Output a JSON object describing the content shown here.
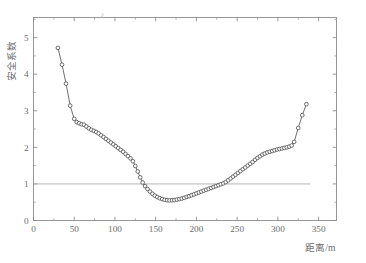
{
  "figure": {
    "background_color": "#ffffff",
    "line_color": "#4a4a4a",
    "axis_color": "#8d8d8d",
    "text_color": "#6b6b6b",
    "refline_color": "#a9a9a9"
  },
  "chart_data": {
    "type": "line",
    "title": "",
    "subtitle": "",
    "xlabel": "距离/m",
    "ylabel": "安全系数",
    "xlim": [
      0,
      372
    ],
    "ylim": [
      0,
      5.55
    ],
    "xticks": [
      0,
      50,
      100,
      150,
      200,
      250,
      300,
      350
    ],
    "xticklabels": [
      "0",
      "50",
      "100",
      "150",
      "200",
      "250",
      "300",
      "350"
    ],
    "yticks": [
      0,
      1,
      2,
      3,
      4,
      5
    ],
    "yticklabels": [
      "0",
      "1",
      "2",
      "3",
      "4",
      "5"
    ],
    "x_minor_tick_step": 25,
    "y_minor_tick_step": 0.5,
    "grid": false,
    "legend": null,
    "marker": "open-circle",
    "annotations": [
      {
        "kind": "reference-line",
        "orientation": "horizontal",
        "y": 1.0,
        "x_start": 0,
        "x_end": 340,
        "label": "safety factor = 1.0"
      }
    ],
    "series": [
      {
        "name": "安全系数",
        "x": [
          30,
          35,
          40,
          45,
          50,
          53,
          56,
          59,
          62,
          65,
          68,
          71,
          74,
          77,
          80,
          83,
          86,
          89,
          92,
          95,
          98,
          101,
          104,
          107,
          110,
          113,
          116,
          119,
          122,
          125,
          128,
          131,
          134,
          137,
          140,
          143,
          146,
          149,
          152,
          155,
          158,
          161,
          164,
          167,
          170,
          173,
          176,
          179,
          182,
          185,
          188,
          191,
          194,
          197,
          200,
          203,
          206,
          209,
          212,
          215,
          218,
          221,
          224,
          227,
          230,
          233,
          236,
          239,
          242,
          245,
          248,
          251,
          254,
          257,
          260,
          263,
          266,
          269,
          272,
          275,
          278,
          281,
          284,
          287,
          290,
          293,
          296,
          299,
          302,
          305,
          308,
          311,
          314,
          317,
          320,
          325,
          330,
          335
        ],
        "y": [
          4.72,
          4.26,
          3.74,
          3.14,
          2.78,
          2.69,
          2.66,
          2.63,
          2.62,
          2.57,
          2.52,
          2.48,
          2.45,
          2.42,
          2.38,
          2.33,
          2.28,
          2.23,
          2.18,
          2.13,
          2.08,
          2.03,
          1.98,
          1.93,
          1.88,
          1.82,
          1.76,
          1.7,
          1.62,
          1.49,
          1.34,
          1.18,
          1.04,
          0.94,
          0.86,
          0.79,
          0.73,
          0.68,
          0.64,
          0.61,
          0.585,
          0.565,
          0.555,
          0.55,
          0.552,
          0.558,
          0.57,
          0.585,
          0.6,
          0.62,
          0.645,
          0.665,
          0.69,
          0.715,
          0.74,
          0.765,
          0.79,
          0.815,
          0.84,
          0.865,
          0.89,
          0.915,
          0.94,
          0.965,
          0.99,
          1.015,
          1.05,
          1.1,
          1.15,
          1.2,
          1.25,
          1.3,
          1.35,
          1.4,
          1.45,
          1.5,
          1.55,
          1.6,
          1.66,
          1.71,
          1.755,
          1.8,
          1.83,
          1.86,
          1.88,
          1.9,
          1.92,
          1.94,
          1.955,
          1.97,
          1.985,
          2.0,
          2.02,
          2.05,
          2.15,
          2.53,
          2.88,
          3.18
        ]
      }
    ]
  }
}
